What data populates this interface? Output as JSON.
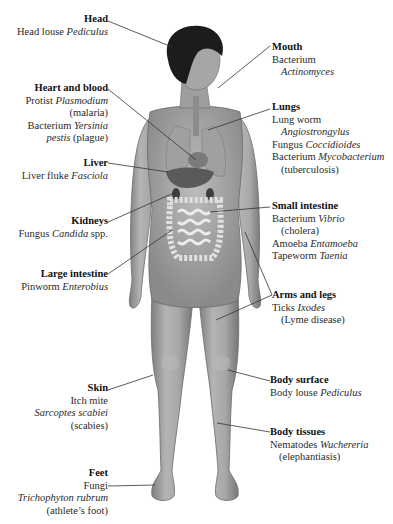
{
  "diagram": {
    "type": "anatomical-labeled-figure",
    "labels": [
      {
        "id": "head",
        "side": "left",
        "title": "Head",
        "lines": [
          [
            {
              "t": "Head louse "
            },
            {
              "t": "Pediculus",
              "i": true
            }
          ]
        ]
      },
      {
        "id": "heart-blood",
        "side": "left",
        "title": "Heart and blood",
        "lines": [
          [
            {
              "t": "Protist "
            },
            {
              "t": "Plasmodium",
              "i": true
            }
          ],
          [
            {
              "t": "(malaria)"
            }
          ],
          [
            {
              "t": "Bacterium "
            },
            {
              "t": "Yersinia",
              "i": true
            }
          ],
          [
            {
              "t": "pestis",
              "i": true
            },
            {
              "t": " (plague)"
            }
          ]
        ]
      },
      {
        "id": "liver",
        "side": "left",
        "title": "Liver",
        "lines": [
          [
            {
              "t": "Liver fluke "
            },
            {
              "t": "Fasciola",
              "i": true
            }
          ]
        ]
      },
      {
        "id": "kidneys",
        "side": "left",
        "title": "Kidneys",
        "lines": [
          [
            {
              "t": "Fungus "
            },
            {
              "t": "Candida",
              "i": true
            },
            {
              "t": " spp."
            }
          ]
        ]
      },
      {
        "id": "large-intestine",
        "side": "left",
        "title": "Large intestine",
        "lines": [
          [
            {
              "t": "Pinworm "
            },
            {
              "t": "Enterobius",
              "i": true
            }
          ]
        ]
      },
      {
        "id": "skin",
        "side": "left",
        "title": "Skin",
        "lines": [
          [
            {
              "t": "Itch mite"
            }
          ],
          [
            {
              "t": "Sarcoptes scabiei",
              "i": true
            }
          ],
          [
            {
              "t": "(scabies)"
            }
          ]
        ]
      },
      {
        "id": "feet",
        "side": "left",
        "title": "Feet",
        "lines": [
          [
            {
              "t": "Fungi"
            }
          ],
          [
            {
              "t": "Trichophyton rubrum",
              "i": true
            }
          ],
          [
            {
              "t": "(athlete’s foot)"
            }
          ]
        ]
      },
      {
        "id": "mouth",
        "side": "right",
        "title": "Mouth",
        "lines": [
          [
            {
              "t": "Bacterium"
            }
          ],
          [
            {
              "t": "Actinomyces",
              "i": true,
              "indent": true
            }
          ]
        ]
      },
      {
        "id": "lungs",
        "side": "right",
        "title": "Lungs",
        "lines": [
          [
            {
              "t": "Lung worm"
            }
          ],
          [
            {
              "t": "Angiostrongylus",
              "i": true,
              "indent": true
            }
          ],
          [
            {
              "t": "Fungus "
            },
            {
              "t": "Coccidioides",
              "i": true
            }
          ],
          [
            {
              "t": "Bacterium "
            },
            {
              "t": "Mycobacterium",
              "i": true
            }
          ],
          [
            {
              "t": "(tuberculosis)",
              "indent": true
            }
          ]
        ]
      },
      {
        "id": "small-intestine",
        "side": "right",
        "title": "Small intestine",
        "lines": [
          [
            {
              "t": "Bacterium "
            },
            {
              "t": "Vibrio",
              "i": true
            }
          ],
          [
            {
              "t": "(cholera)",
              "indent": true
            }
          ],
          [
            {
              "t": "Amoeba "
            },
            {
              "t": "Entamoeba",
              "i": true
            }
          ],
          [
            {
              "t": "Tapeworm "
            },
            {
              "t": "Taenia",
              "i": true
            }
          ]
        ]
      },
      {
        "id": "arms-legs",
        "side": "right",
        "title": "Arms and legs",
        "lines": [
          [
            {
              "t": "Ticks "
            },
            {
              "t": "Ixodes",
              "i": true
            }
          ],
          [
            {
              "t": "(Lyme disease)",
              "indent": true
            }
          ]
        ]
      },
      {
        "id": "body-surface",
        "side": "right",
        "title": "Body surface",
        "lines": [
          [
            {
              "t": "Body louse "
            },
            {
              "t": "Pediculus",
              "i": true
            }
          ]
        ]
      },
      {
        "id": "body-tissues",
        "side": "right",
        "title": "Body tissues",
        "lines": [
          [
            {
              "t": "Nematodes "
            },
            {
              "t": "Wuchereria",
              "i": true
            }
          ],
          [
            {
              "t": "(elephantiasis)",
              "indent": true
            }
          ]
        ]
      }
    ],
    "colors": {
      "skin": "#9a9a9a",
      "skin_light": "#c4c4c4",
      "hair": "#1c1c1c",
      "organ": "#6e6e6e",
      "intestine": "#e6e6e6",
      "leader_line": "#333333",
      "text": "#2a2a2a"
    }
  }
}
